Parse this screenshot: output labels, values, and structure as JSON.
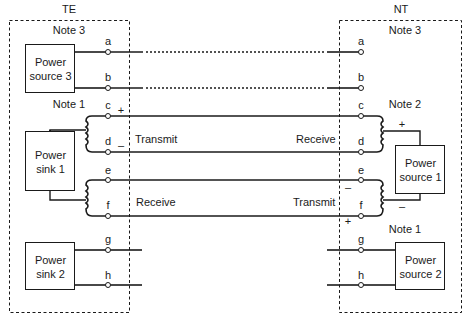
{
  "te": {
    "title": "TE",
    "note_top": "Note 3",
    "note_mid": "Note 1",
    "power_source_3": "Power\nsource 3",
    "power_sink_1": "Power\nsink 1",
    "power_sink_2": "Power\nsink 2"
  },
  "nt": {
    "title": "NT",
    "note_top": "Note 3",
    "note_mid": "Note 2",
    "note_bottom": "Note 1",
    "power_source_1": "Power\nsource 1",
    "power_source_2": "Power\nsource 2"
  },
  "terminals": [
    "a",
    "b",
    "c",
    "d",
    "e",
    "f",
    "g",
    "h"
  ],
  "pair_labels": {
    "te_cd": "Transmit",
    "nt_cd": "Receive",
    "te_ef": "Receive",
    "nt_ef": "Transmit"
  },
  "polarity": {
    "te_c": "+",
    "te_d": "–",
    "nt_source1_top": "+",
    "nt_source1_bottom": "–",
    "nt_e": "–",
    "nt_f": "+"
  },
  "colors": {
    "line": "#1a1a1a",
    "background": "#ffffff"
  }
}
